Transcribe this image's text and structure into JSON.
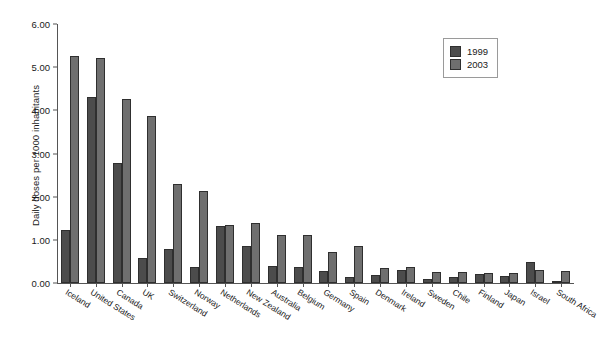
{
  "chart_data": {
    "type": "bar",
    "title": "",
    "xlabel": "",
    "ylabel": "Daily doses per 1000 inhabitants",
    "ylim": [
      0,
      6
    ],
    "yticks": [
      "0.00",
      "1.00",
      "2.00",
      "3.00",
      "4.00",
      "5.00",
      "6.00"
    ],
    "grid": false,
    "legend_position": "top-right",
    "categories": [
      "Iceland",
      "United States",
      "Canada",
      "UK",
      "Switzerland",
      "Norway",
      "Netherlands",
      "New Zealand",
      "Australia",
      "Belgium",
      "Germany",
      "Spain",
      "Denmark",
      "Ireland",
      "Sweden",
      "Chile",
      "Finland",
      "Japan",
      "Israel",
      "South Africa"
    ],
    "series": [
      {
        "name": "1999",
        "color": "#4c4c4c",
        "values": [
          1.23,
          4.31,
          2.77,
          0.59,
          0.79,
          0.36,
          1.31,
          0.86,
          0.4,
          0.38,
          0.28,
          0.15,
          0.19,
          0.3,
          0.1,
          0.14,
          0.22,
          0.17,
          0.49,
          0.04
        ]
      },
      {
        "name": "2003",
        "color": "#6f6f6f",
        "values": [
          5.27,
          5.22,
          4.26,
          3.86,
          2.3,
          2.14,
          1.35,
          1.4,
          1.12,
          1.12,
          0.72,
          0.85,
          0.34,
          0.38,
          0.26,
          0.26,
          0.24,
          0.24,
          0.29,
          0.28
        ]
      }
    ]
  },
  "legend": {
    "entries": [
      {
        "label": "1999"
      },
      {
        "label": "2003"
      }
    ]
  }
}
